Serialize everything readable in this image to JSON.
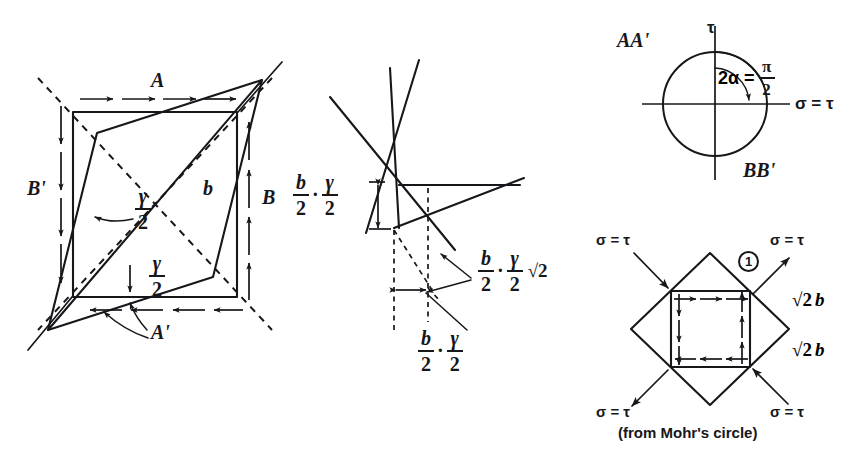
{
  "figure": {
    "caption": "(from Mohr's circle)",
    "ink_color": "#17161a",
    "background_color": "#ffffff"
  },
  "panel_distortion": {
    "name": "sheared square element",
    "labels": {
      "top_edge": "A",
      "bottom_edge": "A'",
      "right_edge": "B",
      "left_edge": "B'",
      "side_length": "b",
      "shear_angle_upper_num": "γ",
      "shear_angle_upper_den": "2",
      "shear_angle_lower_num": "γ",
      "shear_angle_lower_den": "2"
    }
  },
  "panel_detail": {
    "name": "enlarged corner detail",
    "labels": {
      "vertical_offset_first_num": "b",
      "vertical_offset_first_den": "2",
      "vertical_offset_dot": "·",
      "vertical_offset_second_num": "γ",
      "vertical_offset_second_den": "2",
      "diagonal_first_num": "b",
      "diagonal_first_den": "2",
      "diagonal_dot": "·",
      "diagonal_second_num": "γ",
      "diagonal_second_den": "2",
      "diagonal_sqrt": "√2",
      "horizontal_first_num": "b",
      "horizontal_first_den": "2",
      "horizontal_dot": "·",
      "horizontal_second_num": "γ",
      "horizontal_second_den": "2"
    }
  },
  "panel_mohr_circle": {
    "name": "Mohr's circle",
    "labels": {
      "vertical_axis": "τ",
      "horizontal_axis": "σ = τ",
      "upper_left_point": "AA'",
      "lower_right_point": "BB'",
      "angle_lhs": "2α =",
      "angle_num": "π",
      "angle_den": "2"
    }
  },
  "panel_stress_element": {
    "name": "rotated stress element",
    "labels": {
      "stress_top_left": "σ = τ",
      "stress_top_right": "σ = τ",
      "stress_bottom_left": "σ = τ",
      "stress_bottom_right": "σ = τ",
      "callout_number": "1",
      "edge_upper": "√2 b",
      "edge_lower": "√2 b",
      "edge_upper_radical": "√2",
      "edge_upper_var": "b",
      "edge_lower_radical": "√2",
      "edge_lower_var": "b"
    }
  }
}
